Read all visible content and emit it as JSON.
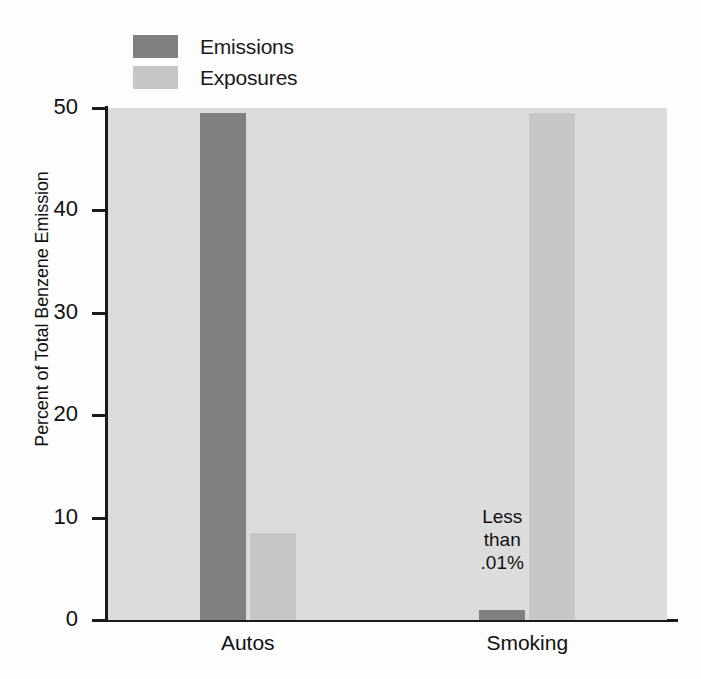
{
  "chart_data": {
    "type": "bar",
    "title": "",
    "subtitle": "",
    "xlabel": "",
    "ylabel": "Percent of Total Benzene Emission",
    "categories": [
      "Autos",
      "Smoking"
    ],
    "series": [
      {
        "name": "Emissions",
        "values": [
          49.5,
          1.0
        ],
        "color": "#808080"
      },
      {
        "name": "Exposures",
        "values": [
          8.5,
          49.5
        ],
        "color": "#c6c6c6"
      }
    ],
    "ylim": [
      0,
      50
    ],
    "yticks": [
      0,
      10,
      20,
      30,
      40,
      50
    ],
    "ytick_labels": [
      "0",
      "10",
      "20",
      "30",
      "40",
      "50"
    ],
    "grid": false,
    "legend_position": "top-left",
    "plot_background": "#dcdcdc",
    "annotations": [
      {
        "text": "Less\nthan\n.01%",
        "attached_to_series": "Emissions",
        "attached_to_category": "Smoking"
      }
    ]
  },
  "legend": {
    "items": [
      {
        "label": "Emissions",
        "color": "#808080"
      },
      {
        "label": "Exposures",
        "color": "#c6c6c6"
      }
    ]
  },
  "axes": {
    "y_title": "Percent of Total Benzene Emission",
    "y_ticks": [
      "50",
      "40",
      "30",
      "20",
      "10",
      "0"
    ],
    "x_ticks": [
      "Autos",
      "Smoking"
    ]
  },
  "annotation_text": "Less\nthan\n.01%"
}
